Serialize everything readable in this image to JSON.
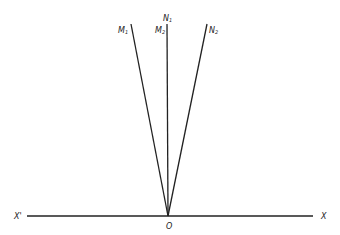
{
  "diagram": {
    "origin": {
      "label": "O",
      "x": 168,
      "y": 216
    },
    "axis": {
      "left_label": "X'",
      "right_label": "X",
      "x1": 27,
      "x2": 313,
      "y": 216
    },
    "rays": [
      {
        "name": "M1",
        "label": "M",
        "sub": "1",
        "x": 131,
        "y": 24
      },
      {
        "name": "N1M2",
        "label_top": "N",
        "sub_top": "1",
        "label": "M",
        "sub": "2",
        "x": 167,
        "y": 24
      },
      {
        "name": "N2",
        "label": "N",
        "sub": "2",
        "x": 207,
        "y": 24
      }
    ],
    "stroke_color": "#222222"
  }
}
